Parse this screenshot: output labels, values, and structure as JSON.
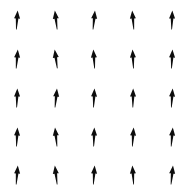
{
  "figure": {
    "width": 185,
    "height": 192,
    "background_color": "#ffffff",
    "arrow_color": "#0d0d0d",
    "title": "",
    "has_axes": false,
    "has_border": false,
    "has_gridlines": false,
    "has_tick_labels": false,
    "has_legend": false
  },
  "chart_data": {
    "type": "scatter",
    "subtype": "quiver",
    "title": "",
    "xlabel": "",
    "ylabel": "",
    "grid": false,
    "legend_position": "none",
    "xlim": [
      0,
      185
    ],
    "ylim": [
      0,
      192
    ],
    "grid_shape": {
      "rows": 5,
      "cols": 5,
      "count": 25
    },
    "x": [
      17,
      56,
      94,
      133,
      172
    ],
    "y": [
      20,
      59,
      98,
      137,
      175
    ],
    "x_spacing": 38.7,
    "y_spacing": 38.7,
    "arrow_length_px": 19,
    "arrow_head_width_px": 6,
    "arrow_head_length_px": 8,
    "vectors": [
      {
        "row": 0,
        "col": 0,
        "cx": 17,
        "cy": 20,
        "angle_deg": 4
      },
      {
        "row": 0,
        "col": 1,
        "cx": 56,
        "cy": 20,
        "angle_deg": -7
      },
      {
        "row": 0,
        "col": 2,
        "cx": 94,
        "cy": 20,
        "angle_deg": 6
      },
      {
        "row": 0,
        "col": 3,
        "cx": 133,
        "cy": 20,
        "angle_deg": -5
      },
      {
        "row": 0,
        "col": 4,
        "cx": 172,
        "cy": 20,
        "angle_deg": 2
      },
      {
        "row": 1,
        "col": 0,
        "cx": 17,
        "cy": 59,
        "angle_deg": 5
      },
      {
        "row": 1,
        "col": 1,
        "cx": 56,
        "cy": 59,
        "angle_deg": -8
      },
      {
        "row": 1,
        "col": 2,
        "cx": 94,
        "cy": 59,
        "angle_deg": -4
      },
      {
        "row": 1,
        "col": 3,
        "cx": 133,
        "cy": 59,
        "angle_deg": -3
      },
      {
        "row": 1,
        "col": 4,
        "cx": 172,
        "cy": 59,
        "angle_deg": 3
      },
      {
        "row": 2,
        "col": 0,
        "cx": 17,
        "cy": 98,
        "angle_deg": 2
      },
      {
        "row": 2,
        "col": 1,
        "cx": 56,
        "cy": 98,
        "angle_deg": 6
      },
      {
        "row": 2,
        "col": 2,
        "cx": 94,
        "cy": 98,
        "angle_deg": 3
      },
      {
        "row": 2,
        "col": 3,
        "cx": 133,
        "cy": 98,
        "angle_deg": 1
      },
      {
        "row": 2,
        "col": 4,
        "cx": 172,
        "cy": 98,
        "angle_deg": 4
      },
      {
        "row": 3,
        "col": 0,
        "cx": 17,
        "cy": 137,
        "angle_deg": 3
      },
      {
        "row": 3,
        "col": 1,
        "cx": 56,
        "cy": 137,
        "angle_deg": -6
      },
      {
        "row": 3,
        "col": 2,
        "cx": 94,
        "cy": 137,
        "angle_deg": 2
      },
      {
        "row": 3,
        "col": 3,
        "cx": 133,
        "cy": 137,
        "angle_deg": 4
      },
      {
        "row": 3,
        "col": 4,
        "cx": 172,
        "cy": 137,
        "angle_deg": 5
      },
      {
        "row": 4,
        "col": 0,
        "cx": 17,
        "cy": 175,
        "angle_deg": 5
      },
      {
        "row": 4,
        "col": 1,
        "cx": 56,
        "cy": 175,
        "angle_deg": -7
      },
      {
        "row": 4,
        "col": 2,
        "cx": 94,
        "cy": 175,
        "angle_deg": 4
      },
      {
        "row": 4,
        "col": 3,
        "cx": 133,
        "cy": 175,
        "angle_deg": -4
      },
      {
        "row": 4,
        "col": 4,
        "cx": 172,
        "cy": 175,
        "angle_deg": 6
      }
    ]
  }
}
